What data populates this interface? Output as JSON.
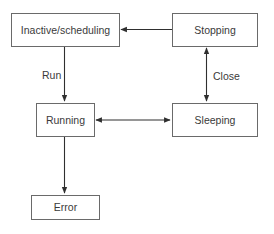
{
  "diagram": {
    "type": "state-transition",
    "nodes": [
      {
        "id": "inactive",
        "label": "Inactive/scheduling"
      },
      {
        "id": "stopping",
        "label": "Stopping"
      },
      {
        "id": "running",
        "label": "Running"
      },
      {
        "id": "sleeping",
        "label": "Sleeping"
      },
      {
        "id": "error",
        "label": "Error"
      }
    ],
    "edges": [
      {
        "from": "stopping",
        "to": "inactive",
        "label": "",
        "direction": "forward"
      },
      {
        "from": "inactive",
        "to": "running",
        "label": "Run",
        "direction": "forward"
      },
      {
        "from": "stopping",
        "to": "sleeping",
        "label": "Close",
        "direction": "both"
      },
      {
        "from": "running",
        "to": "sleeping",
        "label": "",
        "direction": "both"
      },
      {
        "from": "running",
        "to": "error",
        "label": "",
        "direction": "forward"
      }
    ]
  },
  "colors": {
    "stroke": "#2f2f2f",
    "box_border": "#6a6a6a",
    "text": "#3a3a3a",
    "background": "#ffffff"
  }
}
